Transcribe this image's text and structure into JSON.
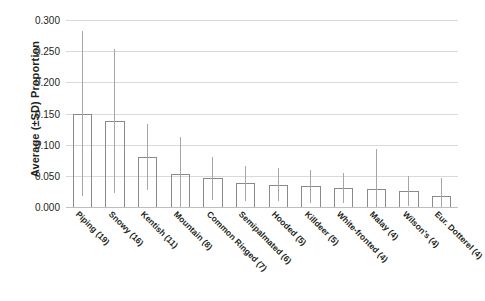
{
  "chart_data": {
    "type": "bar",
    "title": "",
    "xlabel": "",
    "ylabel": "Average (±SD) Proportion",
    "ylim": [
      0.0,
      0.3
    ],
    "grid": true,
    "legend": false,
    "yticks": [
      "0.000",
      "0.050",
      "0.100",
      "0.150",
      "0.200",
      "0.250",
      "0.300"
    ],
    "ytick_values": [
      0.0,
      0.05,
      0.1,
      0.15,
      0.2,
      0.25,
      0.3
    ],
    "categories": [
      "Piping (19)",
      "Snowy (16)",
      "Kentish (11)",
      "Mountain (8)",
      "Common Ringed (7)",
      "Semipalmated (6)",
      "Hooded (5)",
      "Killdeer (5)",
      "White-fronted (4)",
      "Malay (4)",
      "Wilson's (4)",
      "Eur. Dotterel (4)"
    ],
    "values": [
      0.15,
      0.138,
      0.08,
      0.053,
      0.046,
      0.038,
      0.036,
      0.033,
      0.031,
      0.029,
      0.026,
      0.018
    ],
    "errors_upper": [
      0.283,
      0.254,
      0.133,
      0.112,
      0.08,
      0.066,
      0.063,
      0.06,
      0.055,
      0.093,
      0.05,
      0.046
    ],
    "errors_lower": [
      0.017,
      0.022,
      0.027,
      0.0,
      0.012,
      0.01,
      0.009,
      0.006,
      0.007,
      0.0,
      0.002,
      0.0
    ]
  }
}
